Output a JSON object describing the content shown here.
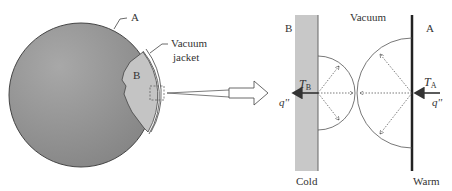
{
  "left_figure": {
    "sphere_label": "A",
    "inner_label": "B",
    "jacket_label_line1": "Vacuum",
    "jacket_label_line2": "jacket"
  },
  "right_figure": {
    "vacuum_label": "Vacuum",
    "cold_surface_label": "B",
    "warm_surface_label": "A",
    "temp_cold": "T",
    "temp_cold_sub": "B",
    "temp_warm": "T",
    "temp_warm_sub": "A",
    "flux_left": "q''",
    "flux_right": "q''",
    "cold_label": "Cold",
    "warm_label": "Warm"
  },
  "colors": {
    "sphere": "#8f8f8f",
    "inner": "#c4c4c4",
    "bar": "#c8c8c8",
    "line": "#333333"
  }
}
